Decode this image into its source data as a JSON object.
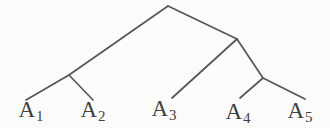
{
  "diagram": {
    "type": "binary-tree",
    "structure_newick": "((A1, A2), (A3, (A4, A5)))",
    "line_color": "#55565a",
    "text_color": "#3f4042",
    "background_color": "#fbfbf9",
    "leaves": [
      {
        "base": "A",
        "sub": "1"
      },
      {
        "base": "A",
        "sub": "2"
      },
      {
        "base": "A",
        "sub": "3"
      },
      {
        "base": "A",
        "sub": "4"
      },
      {
        "base": "A",
        "sub": "5"
      }
    ]
  }
}
